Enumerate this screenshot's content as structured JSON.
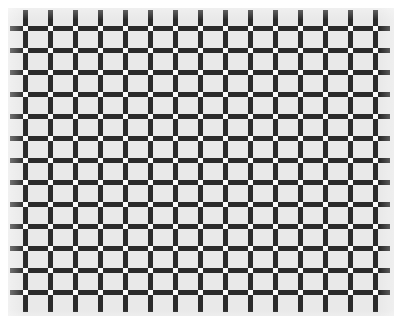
{
  "figure": {
    "name": "scintillating-grid-illusion",
    "background_color": "#ffffff",
    "field_color": "#e9e9e9",
    "bar_color": "#2b2b2b",
    "node_color": "#fbfbfb"
  },
  "canvas": {
    "width": 404,
    "height": 326
  },
  "field": {
    "x": 8,
    "y": 8,
    "width": 386,
    "height": 308
  },
  "grid": {
    "columns": 15,
    "rows": 13,
    "column_pitch": 25,
    "row_pitch": 22,
    "first_column_x": 25,
    "first_row_y": 28,
    "bar_thickness": 5,
    "node_size": 5,
    "vertical_bar_top": 10,
    "vertical_bar_bottom": 312,
    "horizontal_bar_left": 10,
    "horizontal_bar_right": 390
  }
}
